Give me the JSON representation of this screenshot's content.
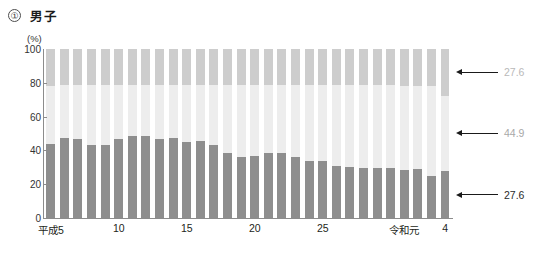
{
  "heading": {
    "number": "①",
    "title": "男子"
  },
  "axes": {
    "unit": "(%)",
    "y_ticks": [
      "100",
      "80",
      "60",
      "40",
      "20",
      "0"
    ],
    "x_tick_labels": [
      {
        "label": "平成5",
        "index": 0
      },
      {
        "label": "10",
        "index": 5
      },
      {
        "label": "15",
        "index": 10
      },
      {
        "label": "20",
        "index": 15
      },
      {
        "label": "25",
        "index": 20
      },
      {
        "label": "令和元",
        "index": 26
      },
      {
        "label": "4",
        "index": 29
      }
    ]
  },
  "annotations": [
    {
      "name": "top",
      "value": "27.6"
    },
    {
      "name": "middle",
      "value": "44.9"
    },
    {
      "name": "bottom",
      "value": "27.6"
    }
  ],
  "colors": {
    "segment_top": "#cdcdcd",
    "segment_middle": "#ededed",
    "segment_bottom": "#8e8e8e",
    "axis": "#8c8c8c"
  },
  "chart_data": {
    "type": "bar",
    "stacked": true,
    "title": "① 男子",
    "xlabel": "",
    "ylabel": "(%)",
    "ylim": [
      0,
      100
    ],
    "grid": false,
    "legend": "none",
    "categories": [
      "平成5",
      "6",
      "7",
      "8",
      "9",
      "10",
      "11",
      "12",
      "13",
      "14",
      "15",
      "16",
      "17",
      "18",
      "19",
      "20",
      "21",
      "22",
      "23",
      "24",
      "25",
      "26",
      "27",
      "28",
      "29",
      "30",
      "令和元",
      "2",
      "3",
      "4"
    ],
    "series": [
      {
        "name": "bottom",
        "values": [
          44.0,
          47.5,
          47.0,
          43.5,
          43.0,
          47.0,
          48.5,
          48.5,
          46.5,
          47.5,
          45.0,
          45.5,
          43.0,
          38.5,
          36.0,
          36.5,
          38.5,
          38.5,
          36.0,
          34.0,
          33.5,
          31.0,
          30.0,
          29.5,
          29.5,
          29.5,
          28.5,
          29.0,
          25.0,
          27.6
        ]
      },
      {
        "name": "middle",
        "values": [
          34.4,
          31.0,
          31.5,
          35.0,
          35.5,
          31.5,
          30.0,
          30.0,
          32.0,
          31.0,
          33.5,
          33.0,
          35.5,
          40.0,
          42.5,
          42.0,
          40.0,
          40.0,
          42.5,
          44.5,
          45.0,
          47.5,
          48.5,
          49.0,
          49.0,
          49.0,
          49.9,
          49.4,
          52.9,
          44.9
        ]
      },
      {
        "name": "top",
        "values": [
          21.6,
          21.5,
          21.5,
          21.5,
          21.5,
          21.5,
          21.5,
          21.5,
          21.5,
          21.5,
          21.5,
          21.5,
          21.5,
          21.5,
          21.5,
          21.5,
          21.5,
          21.5,
          21.5,
          21.5,
          21.5,
          21.5,
          21.5,
          21.5,
          21.5,
          21.5,
          21.6,
          21.6,
          22.1,
          27.6
        ]
      }
    ],
    "annotated_last_bar": {
      "bottom": 27.6,
      "middle": 44.9,
      "top": 27.6
    }
  }
}
